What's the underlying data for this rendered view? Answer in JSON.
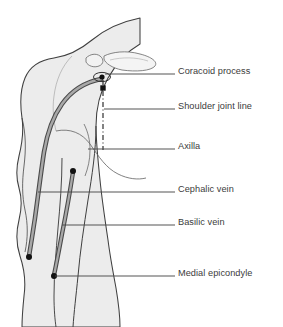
{
  "figure": {
    "type": "anatomical-line-diagram",
    "view": "lateral view of shoulder and arm",
    "background_color": "#ffffff",
    "body_fill_color": "#ececec",
    "body_outline_color": "#3f3f3f",
    "vein_color": "#8a8a8a",
    "vein_edge_color": "#4a4a4a",
    "marker_color": "#111111",
    "leader_line_color": "#4a4a4a",
    "text_color": "#3b3b3b"
  },
  "labels": [
    {
      "id": "coracoid-process",
      "text": "Coracoid process",
      "x": 178,
      "y": 66,
      "leader_from_x": 105,
      "leader_from_y": 74,
      "leader_to_x": 175,
      "leader_to_y": 74,
      "marker": "circle-outline-with-dot"
    },
    {
      "id": "shoulder-joint-line",
      "text": "Shoulder joint line",
      "x": 178,
      "y": 101,
      "leader_from_x": 104,
      "leader_from_y": 109,
      "leader_to_x": 175,
      "leader_to_y": 109,
      "marker": "filled-square"
    },
    {
      "id": "axilla",
      "text": "Axilla",
      "x": 178,
      "y": 141,
      "leader_from_x": 88,
      "leader_from_y": 149,
      "leader_to_x": 175,
      "leader_to_y": 149,
      "marker": "none"
    },
    {
      "id": "cephalic-vein",
      "text": "Cephalic vein",
      "x": 178,
      "y": 184,
      "leader_from_x": 38,
      "leader_from_y": 192,
      "leader_to_x": 175,
      "leader_to_y": 192,
      "marker": "none"
    },
    {
      "id": "basilic-vein",
      "text": "Basilic vein",
      "x": 178,
      "y": 217,
      "leader_from_x": 62,
      "leader_from_y": 225,
      "leader_to_x": 175,
      "leader_to_y": 225,
      "marker": "none"
    },
    {
      "id": "medial-epicondyle",
      "text": "Medial epicondyle",
      "x": 178,
      "y": 268,
      "leader_from_x": 55,
      "leader_from_y": 276,
      "leader_to_x": 175,
      "leader_to_y": 276,
      "marker": "filled-dot"
    }
  ],
  "markers": [
    {
      "id": "coracoid-dot",
      "shape": "dot",
      "x": 102,
      "y": 77,
      "r": 2.6
    },
    {
      "id": "coracoid-ring",
      "shape": "ellipse-outline",
      "x": 102,
      "y": 77,
      "rx": 8.5,
      "ry": 4.6
    },
    {
      "id": "shoulder-joint-square",
      "shape": "square",
      "x": 103,
      "y": 88,
      "size": 5.4
    },
    {
      "id": "cephalic-upper-dot",
      "shape": "dot",
      "x": 73,
      "y": 171,
      "r": 3.0
    },
    {
      "id": "cephalic-lower-dot",
      "shape": "dot",
      "x": 29,
      "y": 257,
      "r": 3.0
    },
    {
      "id": "basilic-lower-dot",
      "shape": "dot",
      "x": 54,
      "y": 276,
      "r": 3.0
    }
  ],
  "dash_dot_axis": {
    "id": "shoulder-joint-axis",
    "x": 103,
    "y_start": 80,
    "y_end": 150,
    "style": "dash-dot vertical"
  },
  "veins": [
    {
      "id": "cephalic-vein-path",
      "name": "Cephalic vein",
      "description": "runs from deltopectoral groove at shoulder, curving laterally down the arm to the lateral elbow"
    },
    {
      "id": "basilic-vein-path",
      "name": "Basilic vein",
      "description": "runs along the medial arm ending at the medial epicondyle"
    }
  ],
  "bones": [
    {
      "id": "clavicle",
      "name": "clavicle"
    },
    {
      "id": "acromion",
      "name": "acromion process"
    }
  ]
}
